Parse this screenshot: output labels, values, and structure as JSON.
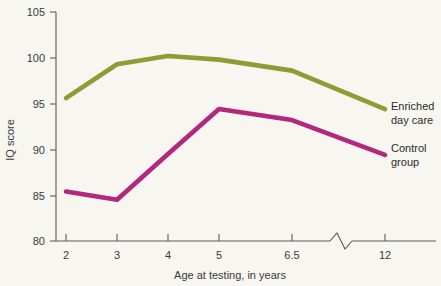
{
  "chart_data": {
    "type": "line",
    "title": "",
    "xlabel": "Age at testing, in years",
    "ylabel": "IQ score",
    "categories": [
      "2",
      "3",
      "4",
      "5",
      "6.5",
      "12"
    ],
    "x_tick_labels": [
      "2",
      "3",
      "4",
      "5",
      "6.5",
      "12"
    ],
    "y_tick_labels": [
      "80",
      "85",
      "90",
      "95",
      "100",
      "105"
    ],
    "ylim": [
      80,
      105
    ],
    "grid": false,
    "axis_break": true,
    "axis_break_note": "zigzag break on x-axis between 6.5 and 12",
    "legend_position": "right-inline",
    "series": [
      {
        "name": "Enriched day care",
        "color": "#8d9c34",
        "label_line1": "Enriched",
        "label_line2": "day care",
        "values": [
          95.6,
          99.3,
          100.2,
          99.8,
          98.6,
          94.4
        ]
      },
      {
        "name": "Control group",
        "color": "#b5267f",
        "label_line1": "Control",
        "label_line2": "group",
        "values": [
          85.4,
          84.5,
          89.5,
          94.4,
          93.2,
          89.4
        ]
      }
    ]
  },
  "axes": {
    "y_axis_title": "IQ score",
    "x_axis_title": "Age at testing, in years"
  },
  "colors": {
    "background": "#f7f6f1",
    "axis": "#5a5a5a",
    "enriched": "#8d9c34",
    "control": "#b5267f"
  }
}
